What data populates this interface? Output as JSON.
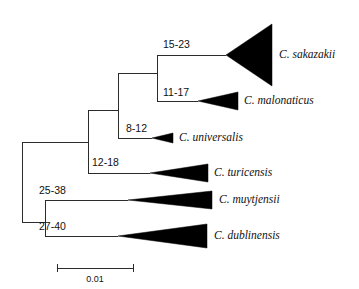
{
  "figure": {
    "type": "phylogenetic-tree",
    "orientation": "left-to-right",
    "background_color": "#ffffff",
    "line_color": "#2b2b2b",
    "clade_fill_color": "#000000"
  },
  "chart_data": {
    "type": "tree",
    "title": "",
    "xlabel": "",
    "ylabel": "",
    "scale_bar": {
      "label": "0.01",
      "value": 0.01,
      "x_start": 57,
      "x_end": 133,
      "y": 268
    },
    "taxa": [
      {
        "name": "C. sakazakii",
        "support": "15-23",
        "apex_x": 226,
        "apex_y": 55,
        "base_x": 272,
        "base_top_y": 24,
        "base_bottom_y": 86,
        "label_x": 279,
        "label_y": 55
      },
      {
        "name": "C. malonaticus",
        "support": "11-17",
        "apex_x": 198,
        "apex_y": 101,
        "base_x": 238,
        "base_top_y": 92,
        "base_bottom_y": 110,
        "label_x": 244,
        "label_y": 101
      },
      {
        "name": "C. universalis",
        "support": "8-12",
        "apex_x": 152,
        "apex_y": 138,
        "base_x": 173,
        "base_top_y": 133,
        "base_bottom_y": 143,
        "label_x": 179,
        "label_y": 138
      },
      {
        "name": "C. turicensis",
        "support": "12-18",
        "apex_x": 150,
        "apex_y": 173,
        "base_x": 208,
        "base_top_y": 164,
        "base_bottom_y": 182,
        "label_x": 214,
        "label_y": 173
      },
      {
        "name": "C. muytjensii",
        "support": "25-38",
        "apex_x": 128,
        "apex_y": 200,
        "base_x": 212,
        "base_top_y": 191,
        "base_bottom_y": 209,
        "label_x": 219,
        "label_y": 200
      },
      {
        "name": "C. dublinensis",
        "support": "27-40",
        "apex_x": 118,
        "apex_y": 236,
        "base_x": 207,
        "base_top_y": 224,
        "base_bottom_y": 248,
        "label_x": 214,
        "label_y": 236
      }
    ],
    "support_labels": [
      {
        "text": "15-23",
        "x": 163,
        "y": 45
      },
      {
        "text": "11-17",
        "x": 163,
        "y": 93
      },
      {
        "text": "8-12",
        "x": 126,
        "y": 129
      },
      {
        "text": "12-18",
        "x": 92,
        "y": 163
      },
      {
        "text": "25-38",
        "x": 39,
        "y": 191
      },
      {
        "text": "27-40",
        "x": 39,
        "y": 227
      }
    ],
    "branches": [
      {
        "id": "root-spine",
        "x1": 22,
        "y1": 142,
        "x2": 22,
        "y2": 222
      },
      {
        "id": "root-to-upper",
        "x1": 22,
        "y1": 142,
        "x2": 60,
        "y2": 142
      },
      {
        "id": "upper-spine",
        "x1": 60,
        "y1": 142,
        "x2": 60,
        "y2": 142
      },
      {
        "id": "nodeA-spine",
        "x1": 88,
        "y1": 110,
        "x2": 88,
        "y2": 173
      },
      {
        "id": "root-upper-connect",
        "x1": 22,
        "y1": 142,
        "x2": 88,
        "y2": 142
      },
      {
        "id": "nodeB-horizontal",
        "x1": 88,
        "y1": 110,
        "x2": 118,
        "y2": 110
      },
      {
        "id": "nodeB-spine",
        "x1": 118,
        "y1": 73,
        "x2": 118,
        "y2": 138
      },
      {
        "id": "nodeC-horizontal",
        "x1": 118,
        "y1": 73,
        "x2": 157,
        "y2": 73
      },
      {
        "id": "nodeC-spine",
        "x1": 157,
        "y1": 55,
        "x2": 157,
        "y2": 101
      },
      {
        "id": "sakazakii-branch",
        "x1": 157,
        "y1": 55,
        "x2": 226,
        "y2": 55
      },
      {
        "id": "malonaticus-branch",
        "x1": 157,
        "y1": 101,
        "x2": 198,
        "y2": 101
      },
      {
        "id": "universalis-branch",
        "x1": 118,
        "y1": 138,
        "x2": 152,
        "y2": 138
      },
      {
        "id": "turicensis-branch",
        "x1": 88,
        "y1": 173,
        "x2": 150,
        "y2": 173
      },
      {
        "id": "lower-node-spine",
        "x1": 45,
        "y1": 200,
        "x2": 45,
        "y2": 236
      },
      {
        "id": "root-to-lower",
        "x1": 22,
        "y1": 222,
        "x2": 45,
        "y2": 222
      },
      {
        "id": "muytjensii-branch",
        "x1": 45,
        "y1": 200,
        "x2": 128,
        "y2": 200
      },
      {
        "id": "dublinensis-branch",
        "x1": 45,
        "y1": 236,
        "x2": 118,
        "y2": 236
      }
    ]
  }
}
